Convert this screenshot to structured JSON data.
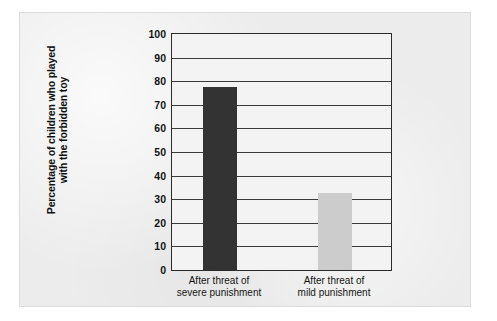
{
  "chart_data": {
    "type": "bar",
    "title": "",
    "subtitle": "",
    "xlabel": "",
    "ylabel": "Percentage of children who played with the forbidden toy",
    "ylabel_lines": [
      "Percentage of children who played",
      "with the forbidden toy"
    ],
    "categories": [
      "After threat of severe punishment",
      "After threat of mild punishment"
    ],
    "category_lines": [
      [
        "After threat of",
        "severe punishment"
      ],
      [
        "After threat of",
        "mild punishment"
      ]
    ],
    "values": [
      77.5,
      32.5
    ],
    "bar_colors": [
      "#333333",
      "#cccccc"
    ],
    "ylim": [
      0,
      100
    ],
    "ytick_values": [
      100,
      90,
      80,
      70,
      60,
      50,
      40,
      30,
      20,
      10,
      0
    ],
    "ytick_labels": [
      "100",
      "90",
      "80",
      "70",
      "60",
      "50",
      "40",
      "30",
      "20",
      "10",
      "0"
    ],
    "grid": true,
    "grid_orientation": "horizontal",
    "legend": false,
    "legend_position": "none"
  },
  "style": {
    "page_background": "#ffffff",
    "panel_background": "#ececec",
    "plot_background": "#f3f3f3",
    "axis_color": "#2b2b2b",
    "grid_color": "#3a3a3a",
    "text_color": "#141414"
  }
}
